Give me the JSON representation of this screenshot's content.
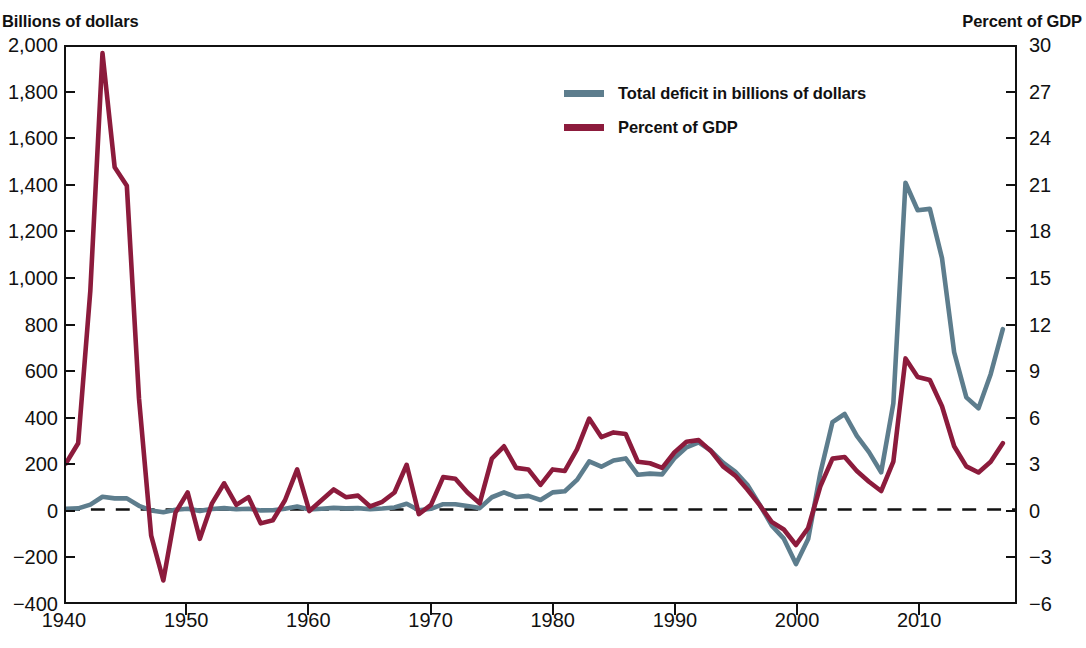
{
  "left_axis": {
    "title": "Billions of dollars",
    "ticks": [
      "2,000",
      "1,800",
      "1,600",
      "1,400",
      "1,200",
      "1,000",
      "800",
      "600",
      "400",
      "200",
      "0",
      "−200",
      "−400"
    ]
  },
  "right_axis": {
    "title": "Percent of GDP",
    "ticks": [
      "30",
      "27",
      "24",
      "21",
      "18",
      "15",
      "12",
      "9",
      "6",
      "3",
      "0",
      "−3",
      "−6"
    ]
  },
  "x_axis": {
    "ticks": [
      "1940",
      "1950",
      "1960",
      "1970",
      "1980",
      "1990",
      "2000",
      "2010"
    ]
  },
  "legend": {
    "items": [
      {
        "label": "Total deficit in billions of dollars",
        "color": "#5d7d8d"
      },
      {
        "label": "Percent of GDP",
        "color": "#8c1b3c"
      }
    ]
  },
  "colors": {
    "deficit_line": "#5d7d8d",
    "gdp_line": "#8c1b3c",
    "axis": "#111111",
    "zero_line": "#111111",
    "background": "#ffffff"
  },
  "chart_data": {
    "type": "line",
    "title": "",
    "subtitle": "",
    "xlabel": "",
    "ylabel": "Billions of dollars",
    "y2label": "Percent of GDP",
    "xlim": [
      1940,
      2018
    ],
    "ylim": [
      -400,
      2000
    ],
    "y2lim": [
      -6,
      30
    ],
    "grid": false,
    "legend_position": "top-center",
    "zero_reference_line": true,
    "x": [
      1940,
      1941,
      1942,
      1943,
      1944,
      1945,
      1946,
      1947,
      1948,
      1949,
      1950,
      1951,
      1952,
      1953,
      1954,
      1955,
      1956,
      1957,
      1958,
      1959,
      1960,
      1961,
      1962,
      1963,
      1964,
      1965,
      1966,
      1967,
      1968,
      1969,
      1970,
      1971,
      1972,
      1973,
      1974,
      1975,
      1976,
      1977,
      1978,
      1979,
      1980,
      1981,
      1982,
      1983,
      1984,
      1985,
      1986,
      1987,
      1988,
      1989,
      1990,
      1991,
      1992,
      1993,
      1994,
      1995,
      1996,
      1997,
      1998,
      1999,
      2000,
      2001,
      2002,
      2003,
      2004,
      2005,
      2006,
      2007,
      2008,
      2009,
      2010,
      2011,
      2012,
      2013,
      2014,
      2015,
      2016,
      2017
    ],
    "series": [
      {
        "name": "Total deficit in billions of dollars",
        "axis": "left",
        "units": "billions of dollars",
        "color": "#5d7d8d",
        "values": [
          -3,
          -5,
          -21,
          -55,
          -48,
          -48,
          -16,
          4,
          12,
          1,
          -3,
          6,
          -2,
          -6,
          -1,
          -3,
          4,
          3,
          -3,
          -13,
          0,
          -3,
          -7,
          -5,
          -6,
          -1,
          -4,
          -9,
          -25,
          3,
          -3,
          -23,
          -23,
          -15,
          -6,
          -53,
          -74,
          -54,
          -59,
          -41,
          -74,
          -79,
          -128,
          -208,
          -185,
          -212,
          -221,
          -150,
          -155,
          -152,
          -221,
          -269,
          -290,
          -255,
          -203,
          -164,
          -107,
          -22,
          69,
          126,
          236,
          128,
          -158,
          -378,
          -413,
          -318,
          -248,
          -161,
          -459,
          -1413,
          -1294,
          -1300,
          -1087,
          -680,
          -485,
          -438,
          -585,
          -780
        ]
      },
      {
        "name": "Percent of GDP",
        "axis": "right",
        "units": "percent of GDP",
        "color": "#8c1b3c",
        "values": [
          3.0,
          4.3,
          14.2,
          29.6,
          22.2,
          21.0,
          7.2,
          -1.7,
          -4.6,
          -0.2,
          1.1,
          -1.9,
          0.4,
          1.7,
          0.3,
          0.8,
          -0.9,
          -0.7,
          0.6,
          2.6,
          -0.1,
          0.6,
          1.3,
          0.8,
          0.9,
          0.2,
          0.5,
          1.1,
          2.9,
          -0.3,
          0.3,
          2.1,
          2.0,
          1.1,
          0.4,
          3.3,
          4.1,
          2.7,
          2.6,
          1.6,
          2.6,
          2.5,
          3.9,
          5.9,
          4.7,
          5.0,
          4.9,
          3.1,
          3.0,
          2.7,
          3.7,
          4.4,
          4.5,
          3.8,
          2.8,
          2.2,
          1.3,
          0.3,
          -0.8,
          -1.3,
          -2.3,
          -1.2,
          1.5,
          3.3,
          3.4,
          2.5,
          1.8,
          1.2,
          3.1,
          9.8,
          8.6,
          8.4,
          6.7,
          4.1,
          2.8,
          2.4,
          3.1,
          4.3
        ]
      }
    ]
  }
}
